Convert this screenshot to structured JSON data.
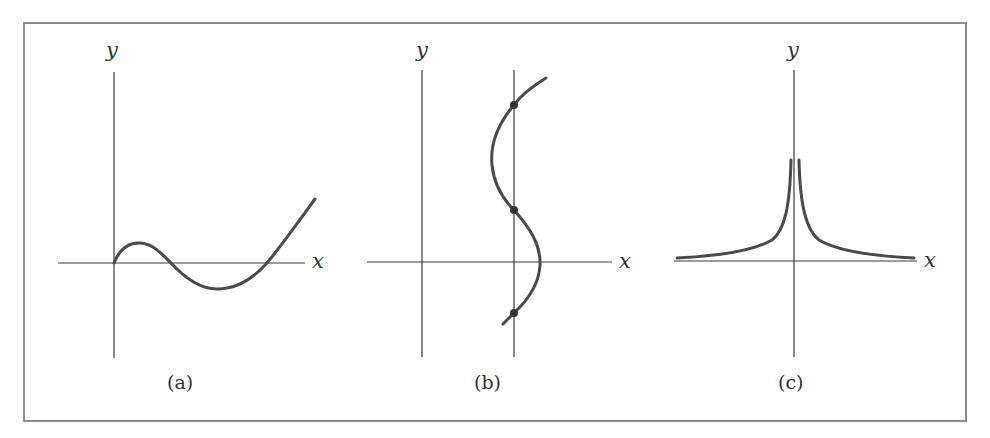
{
  "figure": {
    "colors": {
      "background": "#ffffff",
      "frame": "#8a8a8a",
      "axis": "#3a3a3a",
      "curve": "#4a4a4a",
      "dot": "#333333"
    },
    "panels": [
      {
        "id": "a",
        "caption": "(a)",
        "x_label": "x",
        "y_label": "y",
        "curve_description": "Cubic-like curve starting at origin, rising to a local max, dipping below x-axis to a local min, then rising steeply"
      },
      {
        "id": "b",
        "caption": "(b)",
        "x_label": "x",
        "y_label": "y",
        "curve_description": "S-shaped curve (x as function of y) intersected by a vertical line at three marked points",
        "vertical_test_line": true,
        "intersection_points": 3
      },
      {
        "id": "c",
        "caption": "(c)",
        "x_label": "x",
        "y_label": "y",
        "curve_description": "Symmetric curve like 1/|x| approaching the y-axis upward and decaying toward the x-axis on both sides"
      }
    ]
  }
}
